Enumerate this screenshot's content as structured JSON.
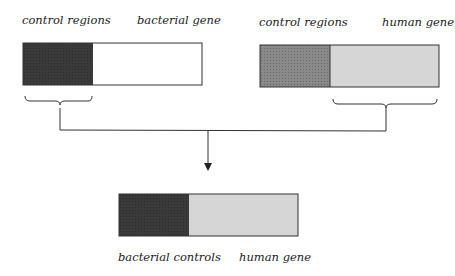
{
  "diagram": {
    "top_left": {
      "label_control": "control regions",
      "label_gene": "bacterial gene",
      "control_color": "#3a3a3a",
      "gene_color": "#ffffff"
    },
    "top_right": {
      "label_control": "control regions",
      "label_gene": "human gene",
      "control_color": "#8a8a8a",
      "gene_color": "#d6d6d6"
    },
    "result": {
      "label_control": "bacterial controls",
      "label_gene": "human gene",
      "control_color": "#3a3a3a",
      "gene_color": "#d6d6d6"
    },
    "line_color": "#333333"
  }
}
